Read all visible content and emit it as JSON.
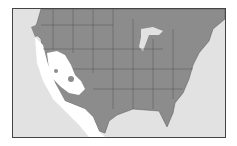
{
  "map": {
    "type": "range-distribution",
    "region": "United States and northern Mexico",
    "colors": {
      "background": "#e2e2e2",
      "range": "#8c8c8c",
      "excluded": "#ffffff",
      "borders": "#555555",
      "frame": "#444444"
    },
    "legend": []
  }
}
